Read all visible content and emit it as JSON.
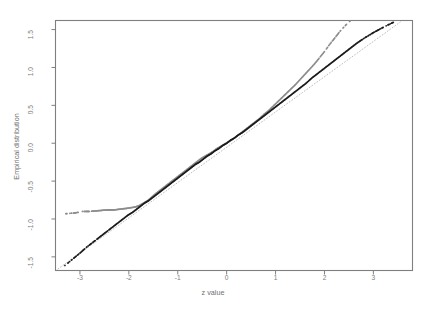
{
  "title": "",
  "axes": {
    "xlabel": "z value",
    "ylabel": "Empirical distribution",
    "xticks": [
      "-3",
      "-2",
      "-1",
      "0",
      "1",
      "2",
      "3"
    ],
    "yticks": [
      "1.5",
      "1.0",
      "0.5",
      "0.0",
      "-0.5",
      "-1.0",
      "-1.5"
    ]
  },
  "colors": {
    "frame": "#7f7f7f",
    "gray_series": "#8c8c8c",
    "black_series": "#1c1c1c",
    "reference_line": "#b5b5b5",
    "text": "#6f6f6f"
  },
  "chart_data": {
    "type": "scatter",
    "title": "",
    "xlabel": "z value",
    "ylabel": "Empirical distribution",
    "xlim": [
      -3.5,
      3.8
    ],
    "ylim": [
      -1.68,
      1.62
    ],
    "grid": false,
    "legend": "none",
    "xticks": [
      -3,
      -2,
      -1,
      0,
      1,
      2,
      3
    ],
    "yticks": [
      -1.5,
      -1.0,
      -0.5,
      0.0,
      0.5,
      1.0,
      1.5
    ],
    "annotations": [
      "Two empirical Q-Q point clouds plotted against a dotted y=x reference line",
      "Gray series has compressed lower tail (flattens near -0.85) and heavy upper tail",
      "Black series tracks the reference line closely in the left tail and falls below it on the right"
    ],
    "series": [
      {
        "name": "gray empirical distribution",
        "color": "#8c8c8c",
        "marker": "dot",
        "x": [
          -3.3,
          -3.1,
          -2.95,
          -2.8,
          -2.62,
          -2.45,
          -2.3,
          -2.18,
          -2.05,
          -1.95,
          -1.86,
          -1.78,
          -1.7,
          -1.62,
          -1.55,
          -1.48,
          -1.4,
          -1.32,
          -1.24,
          -1.16,
          -1.08,
          -1.0,
          -0.92,
          -0.84,
          -0.76,
          -0.68,
          -0.6,
          -0.52,
          -0.44,
          -0.36,
          -0.28,
          -0.2,
          -0.12,
          -0.04,
          0.04,
          0.12,
          0.2,
          0.28,
          0.36,
          0.44,
          0.52,
          0.6,
          0.68,
          0.76,
          0.84,
          0.92,
          1.0,
          1.08,
          1.16,
          1.24,
          1.32,
          1.4,
          1.5,
          1.6,
          1.7,
          1.8,
          1.9,
          2.0,
          2.1,
          2.2,
          2.32,
          2.45,
          2.55
        ],
        "y": [
          -0.93,
          -0.92,
          -0.9,
          -0.9,
          -0.89,
          -0.88,
          -0.88,
          -0.87,
          -0.86,
          -0.85,
          -0.84,
          -0.82,
          -0.79,
          -0.76,
          -0.72,
          -0.68,
          -0.64,
          -0.6,
          -0.56,
          -0.52,
          -0.48,
          -0.44,
          -0.4,
          -0.36,
          -0.32,
          -0.28,
          -0.24,
          -0.2,
          -0.17,
          -0.14,
          -0.11,
          -0.07,
          -0.04,
          -0.01,
          0.02,
          0.05,
          0.09,
          0.13,
          0.17,
          0.21,
          0.25,
          0.29,
          0.33,
          0.38,
          0.42,
          0.47,
          0.52,
          0.57,
          0.62,
          0.67,
          0.72,
          0.77,
          0.84,
          0.91,
          0.98,
          1.05,
          1.13,
          1.21,
          1.3,
          1.38,
          1.48,
          1.57,
          1.63
        ]
      },
      {
        "name": "black empirical distribution",
        "color": "#1c1c1c",
        "marker": "dot",
        "x": [
          -3.32,
          -3.15,
          -3.0,
          -2.88,
          -2.76,
          -2.64,
          -2.52,
          -2.42,
          -2.32,
          -2.22,
          -2.12,
          -2.02,
          -1.92,
          -1.84,
          -1.76,
          -1.68,
          -1.6,
          -1.52,
          -1.44,
          -1.36,
          -1.28,
          -1.2,
          -1.12,
          -1.04,
          -0.96,
          -0.88,
          -0.8,
          -0.72,
          -0.64,
          -0.56,
          -0.48,
          -0.4,
          -0.32,
          -0.24,
          -0.16,
          -0.08,
          0.0,
          0.08,
          0.16,
          0.24,
          0.32,
          0.4,
          0.48,
          0.56,
          0.64,
          0.72,
          0.8,
          0.88,
          0.96,
          1.04,
          1.12,
          1.2,
          1.3,
          1.4,
          1.5,
          1.62,
          1.74,
          1.86,
          1.98,
          2.1,
          2.24,
          2.38,
          2.52,
          2.66,
          2.82,
          3.0,
          3.2,
          3.42
        ],
        "y": [
          -1.62,
          -1.53,
          -1.45,
          -1.38,
          -1.32,
          -1.26,
          -1.2,
          -1.15,
          -1.1,
          -1.05,
          -1.0,
          -0.95,
          -0.91,
          -0.87,
          -0.83,
          -0.79,
          -0.76,
          -0.72,
          -0.68,
          -0.64,
          -0.6,
          -0.56,
          -0.52,
          -0.48,
          -0.44,
          -0.4,
          -0.36,
          -0.32,
          -0.28,
          -0.25,
          -0.21,
          -0.17,
          -0.14,
          -0.1,
          -0.07,
          -0.03,
          0.0,
          0.04,
          0.07,
          0.11,
          0.14,
          0.18,
          0.22,
          0.26,
          0.3,
          0.34,
          0.38,
          0.42,
          0.46,
          0.5,
          0.54,
          0.58,
          0.63,
          0.68,
          0.73,
          0.79,
          0.86,
          0.92,
          0.98,
          1.04,
          1.11,
          1.18,
          1.25,
          1.32,
          1.39,
          1.46,
          1.53,
          1.6
        ]
      },
      {
        "name": "reference line y = x",
        "color": "#b5b5b5",
        "marker": "dotted-line",
        "x": [
          -3.45,
          3.55
        ],
        "y": [
          -1.66,
          1.6
        ]
      }
    ]
  }
}
